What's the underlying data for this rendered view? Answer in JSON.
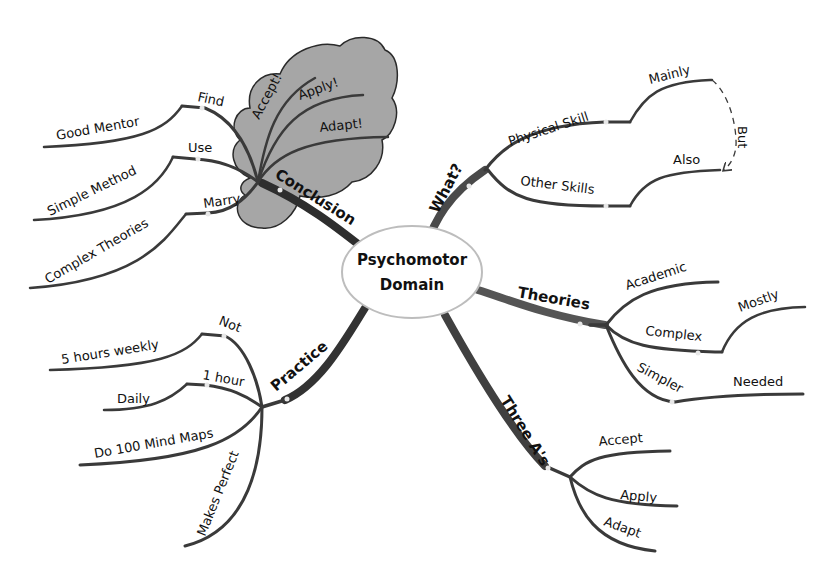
{
  "colors": {
    "background": "#ffffff",
    "line": "#3a3a3a",
    "main_branch": "#2e2e2e",
    "cloud_fill": "#a6a6a6",
    "cloud_stroke": "#2a2a2a",
    "center_fill": "#ffffff",
    "center_stroke": "#bdbdbd"
  },
  "center": {
    "line1": "Psychomotor",
    "line2": "Domain"
  },
  "branches": {
    "what": {
      "label": "What?",
      "children": [
        {
          "label": "Physical Skill",
          "child": "Mainly"
        },
        {
          "label": "Other Skills",
          "child": "Also"
        }
      ],
      "relationship": {
        "label": "But",
        "from": "Mainly",
        "to": "Also",
        "style": "dashed-arrow"
      }
    },
    "theories": {
      "label": "Theories",
      "children": [
        {
          "label": "Academic"
        },
        {
          "label": "Complex",
          "child": "Mostly"
        },
        {
          "label": "Simpler",
          "child": "Needed"
        }
      ]
    },
    "three_as": {
      "label": "Three A's",
      "children": [
        {
          "label": "Accept"
        },
        {
          "label": "Apply"
        },
        {
          "label": "Adapt"
        }
      ]
    },
    "practice": {
      "label": "Practice",
      "children": [
        {
          "label": "Not",
          "child": "5 hours weekly"
        },
        {
          "label": "1 hour",
          "child": "Daily"
        },
        {
          "label": "Do 100 Mind Maps"
        },
        {
          "label": "Makes Perfect"
        }
      ]
    },
    "conclusion": {
      "label": "Conclusion",
      "boundary": "cloud",
      "children": [
        {
          "label": "Find",
          "child": "Good Mentor"
        },
        {
          "label": "Use",
          "child": "Simple Method"
        },
        {
          "label": "Marry",
          "child": "Complex Theories"
        },
        {
          "label": "Accept!"
        },
        {
          "label": "Apply!"
        },
        {
          "label": "Adapt!"
        }
      ]
    }
  }
}
